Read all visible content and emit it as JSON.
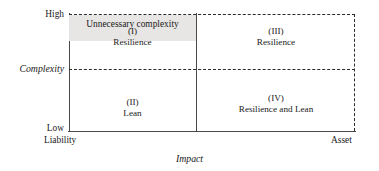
{
  "chart_data": {
    "type": "table",
    "title": "",
    "xlabel": "Impact",
    "ylabel": "Complexity",
    "grid": false,
    "legend": "none",
    "x_axis": {
      "label": "Impact",
      "min_label": "Liability",
      "max_label": "Asset"
    },
    "y_axis": {
      "label": "Complexity",
      "min_label": "Low",
      "max_label": "High"
    },
    "quadrants": [
      {
        "id": "I",
        "roman": "(I)",
        "name": "Resilience",
        "x": "Liability",
        "y": "High"
      },
      {
        "id": "III",
        "roman": "(III)",
        "name": "Resilience",
        "x": "Asset",
        "y": "High"
      },
      {
        "id": "II",
        "roman": "(II)",
        "name": "Lean",
        "x": "Liability",
        "y": "Low"
      },
      {
        "id": "IV",
        "roman": "(IV)",
        "name": "Resilience and Lean",
        "x": "Asset",
        "y": "Low"
      }
    ],
    "annotations": [
      {
        "text": "Unnecessary complexity",
        "region": "left-half just below complexity threshold"
      }
    ]
  },
  "axes": {
    "y": {
      "title": "Complexity",
      "high_label": "High",
      "low_label": "Low"
    },
    "x": {
      "title": "Impact",
      "left_label": "Liability",
      "right_label": "Asset"
    }
  },
  "quadrants": {
    "q1": {
      "roman": "(I)",
      "name": "Resilience"
    },
    "q3": {
      "roman": "(III)",
      "name": "Resilience"
    },
    "q2": {
      "roman": "(II)",
      "name": "Lean"
    },
    "q4": {
      "roman": "(IV)",
      "name": "Resilience and Lean"
    }
  },
  "band": {
    "unnecessary_complexity_label": "Unnecessary complexity"
  },
  "colors": {
    "line": "#4a4a4a",
    "dashed_line": "#2b2b2b",
    "band_fill": "#e8e6e4",
    "text": "#1a1a1a",
    "background": "#ffffff"
  }
}
